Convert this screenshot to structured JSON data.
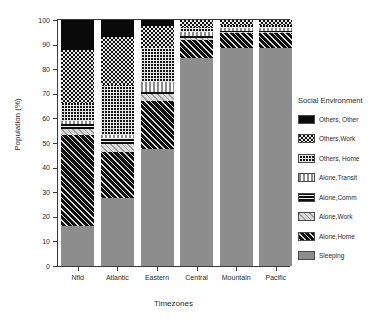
{
  "chart_data": {
    "type": "bar",
    "subtype": "stacked-bar-100-percent",
    "title": "",
    "xlabel": "Timezones",
    "ylabel": "Population (%)",
    "ylim": [
      0,
      100
    ],
    "ytick_step": 10,
    "yticks": [
      0,
      10,
      20,
      30,
      40,
      50,
      60,
      70,
      80,
      90,
      100
    ],
    "grid": false,
    "legend_title": "Social Environment",
    "legend_position": "right",
    "categories": [
      "Nfld",
      "Atlantic",
      "Eastern",
      "Central",
      "Mountain",
      "Pacific"
    ],
    "stack_order_bottom_to_top": [
      "Sleeping",
      "Alone,Home",
      "Alone,Work",
      "Alone,Comm",
      "Alone,Transit",
      "Others, Home",
      "Others,Work",
      "Others, Other"
    ],
    "series": [
      {
        "name": "Others, Other",
        "pattern": "solid-black",
        "values": [
          12.2,
          7.0,
          2.4,
          0.0,
          0.0,
          0.0
        ]
      },
      {
        "name": "Others,Work",
        "pattern": "checkerboard",
        "values": [
          21.5,
          19.5,
          9.0,
          2.8,
          2.0,
          2.0
        ]
      },
      {
        "name": "Others, Home",
        "pattern": "grid-mesh",
        "values": [
          7.3,
          20.3,
          13.8,
          2.0,
          1.2,
          1.2
        ]
      },
      {
        "name": "Alone,Transit",
        "pattern": "vertical-bars",
        "values": [
          1.2,
          1.2,
          4.1,
          1.6,
          1.2,
          1.2
        ]
      },
      {
        "name": "Alone,Comm",
        "pattern": "horizontal-bars",
        "values": [
          2.0,
          2.4,
          0.8,
          0.8,
          0.4,
          0.4
        ]
      },
      {
        "name": "Alone,Work",
        "pattern": "light-diagonal",
        "values": [
          2.5,
          3.3,
          2.9,
          0.8,
          0.4,
          0.4
        ]
      },
      {
        "name": "Alone,Home",
        "pattern": "dark-diagonal",
        "values": [
          37.0,
          18.7,
          19.5,
          7.3,
          6.1,
          6.1
        ]
      },
      {
        "name": "Sleeping",
        "pattern": "solid-gray",
        "values": [
          16.3,
          27.6,
          47.5,
          84.7,
          88.7,
          88.7
        ]
      }
    ],
    "colors": {
      "solid-black": "#0a0a0a",
      "solid-gray": "#8d8d8d",
      "axis": "#3a3a3a",
      "text": "#2b2b2b",
      "background": "#ffffff"
    }
  },
  "axes": {
    "y_title": "Population (%)",
    "x_title": "Timezones",
    "y_ticks": [
      "0",
      "10",
      "20",
      "30",
      "40",
      "50",
      "60",
      "70",
      "80",
      "90",
      "100"
    ],
    "x_ticks": [
      "Nfld",
      "Atlantic",
      "Eastern",
      "Central",
      "Mountain",
      "Pacific"
    ]
  },
  "legend": {
    "title": "Social Environment",
    "items": [
      {
        "label": "Others, Other",
        "pattern": "solid-black"
      },
      {
        "label": "Others,Work",
        "pattern": "checkerboard"
      },
      {
        "label": "Others, Home",
        "pattern": "grid-mesh"
      },
      {
        "label": "Alone,Transit",
        "pattern": "vertical-bars"
      },
      {
        "label": "Alone,Comm",
        "pattern": "horizontal-bars"
      },
      {
        "label": "Alone,Work",
        "pattern": "light-diagonal"
      },
      {
        "label": "Alone,Home",
        "pattern": "dark-diagonal"
      },
      {
        "label": "Sleeping",
        "pattern": "solid-gray"
      }
    ]
  }
}
